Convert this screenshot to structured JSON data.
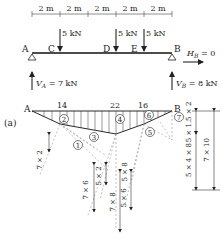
{
  "beam": {
    "spans": [
      "2 m",
      "2 m",
      "2 m",
      "2 m",
      "2 m"
    ],
    "points": {
      "A": "A",
      "C": "C",
      "D": "D",
      "E": "E",
      "B": "B"
    },
    "loads": [
      "5 kN",
      "5 kN",
      "5 kN"
    ],
    "horizontal_reaction": "H",
    "horizontal_reaction_sub": "B",
    "horizontal_reaction_val": " = 0",
    "reaction_A": "V",
    "reaction_A_sub": "A",
    "reaction_A_val": " = 7 kN",
    "reaction_B": "V",
    "reaction_B_sub": "B",
    "reaction_B_val": " = 8 kN"
  },
  "moment_diagram": {
    "label": "(a)",
    "point_A": "A",
    "point_B": "B",
    "values": [
      "14",
      "22",
      "16"
    ],
    "regions": [
      "1",
      "2",
      "3",
      "4",
      "5",
      "6",
      "7"
    ],
    "dims": {
      "d72": "7 × 2",
      "d76": "7 × 6",
      "d52": "5 × 2",
      "d78": "7 × 8",
      "d58": "5 × 8",
      "d56": "5 × 6",
      "d512": "5 × 1.5 × 2",
      "d548": "5 × 4 × 8",
      "d710": "7 × 10"
    }
  }
}
